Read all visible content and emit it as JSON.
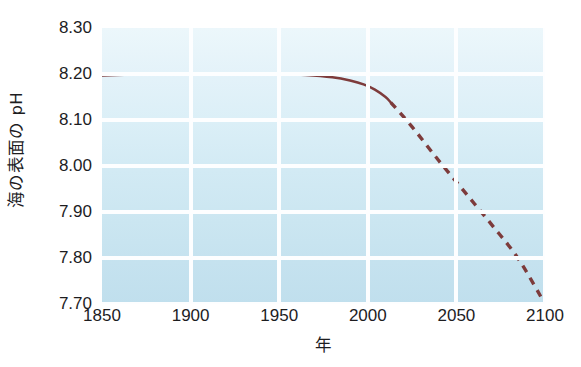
{
  "chart_data": {
    "type": "line",
    "title": "",
    "subtitle": "",
    "xlabel": "年",
    "ylabel": "海の表面の pH",
    "xlim": [
      1850,
      2100
    ],
    "ylim": [
      7.7,
      8.3
    ],
    "xticks": [
      "1850",
      "1900",
      "1950",
      "2000",
      "2050",
      "2100"
    ],
    "xtick_values": [
      1850,
      1900,
      1950,
      2000,
      2050,
      2100
    ],
    "yticks": [
      "8.30",
      "8.20",
      "8.10",
      "8.00",
      "7.90",
      "7.80",
      "7.70"
    ],
    "ytick_values": [
      8.3,
      8.2,
      8.1,
      8.0,
      7.9,
      7.8,
      7.7
    ],
    "grid": true,
    "grid_color": "#fdfeff",
    "legend": null,
    "plot_background_top": "#ecf7fb",
    "plot_background_bottom": "#c0dfed",
    "line_color": "#7d3b3b",
    "series": [
      {
        "name": "observed",
        "style": "solid",
        "x": [
          1850,
          1870,
          1890,
          1910,
          1930,
          1950,
          1965,
          1980,
          1990,
          1998,
          2004,
          2010,
          2013
        ],
        "values": [
          8.197,
          8.199,
          8.2,
          8.201,
          8.201,
          8.2,
          8.198,
          8.193,
          8.186,
          8.177,
          8.166,
          8.15,
          8.138
        ]
      },
      {
        "name": "projected",
        "style": "dashed",
        "x": [
          2013,
          2025,
          2040,
          2055,
          2070,
          2085,
          2100
        ],
        "values": [
          8.138,
          8.085,
          8.012,
          7.942,
          7.872,
          7.798,
          7.7
        ]
      }
    ],
    "annotations": []
  }
}
